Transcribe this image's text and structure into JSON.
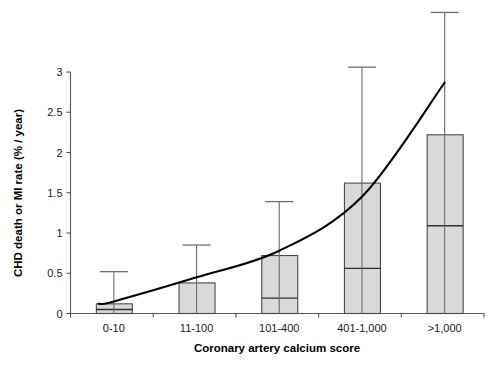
{
  "chart_data": {
    "type": "bar",
    "title": "",
    "xlabel": "Coronary artery calcium score",
    "ylabel": "CHD death or MI rate (% / year)",
    "categories": [
      "0-10",
      "11-100",
      "101-400",
      "401-1,000",
      ">1,000"
    ],
    "ylim": [
      0,
      3
    ],
    "yticks": [
      0,
      0.5,
      1,
      1.5,
      2,
      2.5,
      3
    ],
    "ytick_labels": [
      "0",
      "0.5",
      "1",
      "1.5",
      "2",
      "2.5",
      "3"
    ],
    "grid": false,
    "legend": null,
    "series": [
      {
        "name": "CHD death or MI rate (box upper bound)",
        "values": [
          0.12,
          0.38,
          0.72,
          1.62,
          2.22
        ]
      },
      {
        "name": "CHD death or MI rate (box lower bound / point estimate)",
        "values": [
          0.05,
          0.0,
          0.19,
          0.56,
          1.09
        ]
      },
      {
        "name": "Upper error bar (whisker cap)",
        "values": [
          0.52,
          0.85,
          1.39,
          3.06,
          3.74
        ]
      }
    ],
    "trend_curve": {
      "name": "Fitted exponential trend",
      "x_values": [
        1,
        2,
        3,
        4,
        5
      ],
      "y_values": [
        0.15,
        0.45,
        0.78,
        1.45,
        2.87
      ]
    },
    "colors": {
      "bar_fill": "#d9d9d9",
      "bar_stroke": "#4a4a4a",
      "curve": "#000000",
      "whisker": "#6d6d6d",
      "axis": "#555555"
    }
  },
  "footer": {
    "smudge_text": ""
  }
}
